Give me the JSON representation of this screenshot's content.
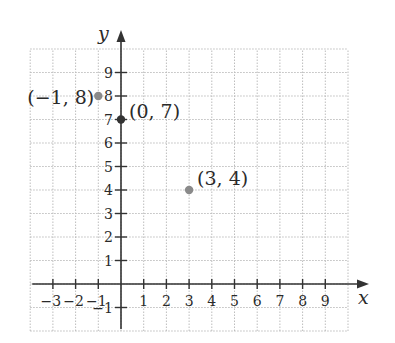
{
  "chart_data": {
    "type": "scatter",
    "title": "",
    "xlabel": "x",
    "ylabel": "y",
    "xlim": [
      -4,
      10
    ],
    "ylim": [
      -2,
      10
    ],
    "grid": true,
    "grid_style": "dotted",
    "x_ticks": [
      -3,
      -2,
      -1,
      1,
      2,
      3,
      4,
      5,
      6,
      7,
      8,
      9
    ],
    "x_tick_labels": [
      "−3",
      "−2",
      "−1",
      "1",
      "2",
      "3",
      "4",
      "5",
      "6",
      "7",
      "8",
      "9"
    ],
    "y_ticks": [
      -1,
      1,
      2,
      3,
      4,
      5,
      6,
      7,
      8,
      9
    ],
    "y_tick_labels": [
      "−1",
      "1",
      "2",
      "3",
      "4",
      "5",
      "6",
      "7",
      "8",
      "9"
    ],
    "points": [
      {
        "x": -1,
        "y": 8,
        "label": "(−1, 8)",
        "color": "#8a8a8a"
      },
      {
        "x": 0,
        "y": 7,
        "label": "(0, 7)",
        "color": "#333333"
      },
      {
        "x": 3,
        "y": 4,
        "label": "(3, 4)",
        "color": "#8a8a8a"
      }
    ],
    "colors": {
      "axis": "#333333",
      "grid": "#bdbdbd",
      "text": "#2a2a2a"
    }
  }
}
